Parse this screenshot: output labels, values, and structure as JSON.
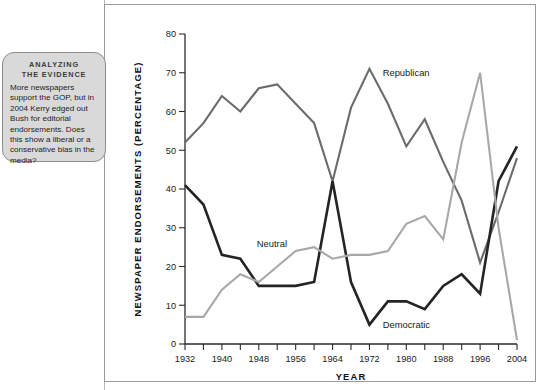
{
  "callout": {
    "heading_line1": "ANALYZING",
    "heading_line2": "THE EVIDENCE",
    "body": "More newspapers support the GOP, but in 2004 Kerry edged out Bush for editorial endorsements. Does this show a liberal or a conservative bias in the media?"
  },
  "chart_data": {
    "type": "line",
    "title": "",
    "xlabel": "YEAR",
    "ylabel": "NEWSPAPER ENDORSEMENTS (PERCENTAGE)",
    "xlim": [
      1932,
      2004
    ],
    "ylim": [
      0,
      80
    ],
    "ytick_step": 10,
    "yticks": [
      0,
      10,
      20,
      30,
      40,
      50,
      60,
      70,
      80
    ],
    "xticks_major": [
      1932,
      1940,
      1948,
      1956,
      1964,
      1972,
      1980,
      1988,
      1996,
      2004
    ],
    "xticks_minor_step": 4,
    "grid": false,
    "legend_position": "inline-annotations",
    "x": [
      1932,
      1936,
      1940,
      1944,
      1948,
      1952,
      1956,
      1960,
      1964,
      1968,
      1972,
      1976,
      1980,
      1984,
      1988,
      1992,
      1996,
      2000,
      2004
    ],
    "series": [
      {
        "name": "Republican",
        "color": "#6b6b6b",
        "label_x": 1974,
        "label_y": 70,
        "values": [
          52,
          57,
          64,
          60,
          66,
          67,
          62,
          57,
          42,
          61,
          71,
          62,
          51,
          58,
          47,
          37,
          21,
          34,
          48
        ]
      },
      {
        "name": "Democratic",
        "color": "#242424",
        "label_x": 1974,
        "label_y": 5,
        "values": [
          41,
          36,
          23,
          22,
          15,
          15,
          15,
          16,
          42,
          16,
          5,
          11,
          11,
          9,
          15,
          18,
          13,
          42,
          51
        ]
      },
      {
        "name": "Neutral",
        "color": "#a8a8a8",
        "label_x": 1955,
        "label_y": 26,
        "values": [
          7,
          7,
          14,
          18,
          16,
          20,
          24,
          25,
          22,
          23,
          23,
          24,
          31,
          33,
          27,
          52,
          70,
          30,
          1
        ]
      }
    ]
  }
}
